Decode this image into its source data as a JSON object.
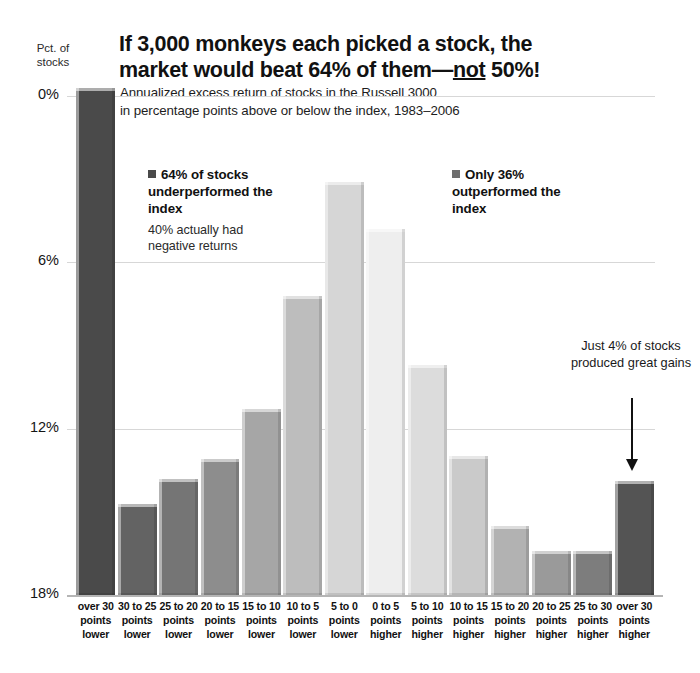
{
  "header": {
    "title_part1": "If 3,000 monkeys each picked a stock, the market would beat 64% of them—",
    "title_underlined": "not",
    "title_part2": " 50%!",
    "title_full": "If 3,000 monkeys each picked a stock, the market would beat 64% of them—not 50%!",
    "subtitle_line1": "Annualized excess return of stocks in the Russell 3000",
    "subtitle_line2": "in percentage points above or below the index, 1983–2006"
  },
  "axis": {
    "y_caption_line1": "Pct. of",
    "y_caption_line2": "stocks",
    "y_ticks": [
      "18%",
      "12%",
      "6%",
      "0%"
    ]
  },
  "annotations": {
    "left_legend_title": "64% of stocks underperformed the index",
    "left_legend_sub": "40% actually had negative returns",
    "right_legend_title": "Only 36% outperformed the index",
    "callout": "Just 4% of stocks produced great gains",
    "left_marker_color": "#4a4a4a",
    "right_marker_color": "#6e6e6e"
  },
  "chart_data": {
    "type": "bar",
    "title": "If 3,000 monkeys each picked a stock, the market would beat 64% of them—not 50%!",
    "subtitle": "Annualized excess return of stocks in the Russell 3000 in percentage points above or below the index, 1983–2006",
    "xlabel": "",
    "ylabel": "Pct. of stocks",
    "ylim": [
      0,
      19.3
    ],
    "yticks": [
      0,
      6,
      12,
      18
    ],
    "grid": true,
    "legend": "none",
    "categories": [
      "over 30 points lower",
      "30 to 25 points lower",
      "25 to 20 points lower",
      "20 to 15 points lower",
      "15 to 10 points lower",
      "10 to 5 points lower",
      "5 to 0 points lower",
      "0 to 5 points higher",
      "5 to 10 points higher",
      "10 to 15 points higher",
      "15 to 20 points higher",
      "20 to 25 points higher",
      "25 to 30 points higher",
      "over 30 points higher"
    ],
    "category_lines": [
      [
        "over 30",
        "points",
        "lower"
      ],
      [
        "30 to 25",
        "points",
        "lower"
      ],
      [
        "25 to 20",
        "points",
        "lower"
      ],
      [
        "20 to 15",
        "points",
        "lower"
      ],
      [
        "15 to 10",
        "points",
        "lower"
      ],
      [
        "10 to 5",
        "points",
        "lower"
      ],
      [
        "5 to 0",
        "points",
        "lower"
      ],
      [
        "0 to 5",
        "points",
        "higher"
      ],
      [
        "5 to 10",
        "points",
        "higher"
      ],
      [
        "10 to 15",
        "points",
        "higher"
      ],
      [
        "15 to 20",
        "points",
        "higher"
      ],
      [
        "20 to 25",
        "points",
        "higher"
      ],
      [
        "25 to 30",
        "points",
        "higher"
      ],
      [
        "over 30",
        "points",
        "higher"
      ]
    ],
    "values": [
      18.3,
      3.3,
      4.2,
      4.9,
      6.7,
      10.8,
      14.9,
      13.2,
      8.3,
      5.0,
      2.5,
      1.6,
      1.6,
      4.1
    ],
    "colors": [
      "#4a4a4a",
      "#636363",
      "#757575",
      "#8d8d8d",
      "#a6a6a6",
      "#bdbdbd",
      "#d6d6d6",
      "#eeeeee",
      "#dcdcdc",
      "#cacaca",
      "#b2b2b2",
      "#9a9a9a",
      "#7d7d7d",
      "#545454"
    ]
  }
}
